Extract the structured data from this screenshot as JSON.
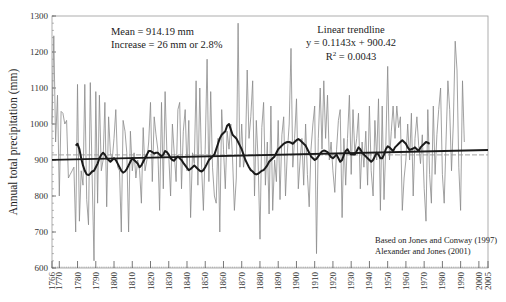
{
  "chart_data": {
    "type": "line",
    "title": "",
    "xlabel": "",
    "ylabel": "Annual total precipitation (mm)",
    "xlim": [
      1766,
      2005
    ],
    "ylim": [
      600,
      1300
    ],
    "yticks": [
      600,
      700,
      800,
      900,
      1000,
      1100,
      1200,
      1300
    ],
    "xticks": [
      1766,
      1770,
      1780,
      1790,
      1800,
      1810,
      1820,
      1830,
      1840,
      1850,
      1860,
      1870,
      1880,
      1890,
      1900,
      1910,
      1920,
      1930,
      1940,
      1950,
      1960,
      1970,
      1980,
      1990,
      2000,
      2005
    ],
    "grid": false,
    "annotations": {
      "mean": "Mean = 914.19 mm",
      "increase": "Increase = 26 mm or 2.8%",
      "trend_title": "Linear trendline",
      "trend_eq": "y = 0.1143x + 900.42",
      "r2_prefix": "R",
      "r2_sup": "2",
      "r2_value": " = 0.0043",
      "source_1": "Based on Jones and Conway (1997)",
      "source_2": "Alexander and Jones (2001)"
    },
    "mean_value": 914.19,
    "trend": {
      "slope": 0.1143,
      "intercept": 900.42
    },
    "series": [
      {
        "name": "Annual total",
        "style": "thin-gray",
        "start_year": 1766,
        "values": [
          1000,
          1245,
          950,
          1080,
          800,
          1035,
          1030,
          1000,
          1010,
          850,
          860,
          870,
          880,
          700,
          1110,
          730,
          870,
          830,
          1110,
          790,
          720,
          1115,
          860,
          620,
          1090,
          780,
          1080,
          870,
          900,
          1060,
          770,
          1020,
          920,
          900,
          960,
          1040,
          880,
          870,
          700,
          1010,
          980,
          920,
          700,
          980,
          870,
          920,
          850,
          900,
          870,
          780,
          990,
          870,
          900,
          950,
          1060,
          840,
          1020,
          970,
          930,
          760,
          1060,
          820,
          1090,
          920,
          910,
          800,
          1000,
          920,
          840,
          1040,
          1060,
          820,
          980,
          1040,
          870,
          1010,
          740,
          920,
          890,
          1120,
          830,
          1100,
          880,
          760,
          930,
          1180,
          840,
          1090,
          880,
          800,
          780,
          960,
          700,
          1040,
          930,
          820,
          980,
          930,
          1000,
          900,
          760,
          850,
          1280,
          880,
          1000,
          880,
          920,
          1150,
          960,
          1020,
          1120,
          800,
          1010,
          900,
          680,
          990,
          1060,
          830,
          950,
          750,
          1050,
          760,
          900,
          840,
          1010,
          790,
          970,
          1020,
          800,
          920,
          1000,
          1210,
          880,
          960,
          1070,
          820,
          900,
          960,
          830,
          1000,
          860,
          770,
          930,
          1000,
          1050,
          640,
          960,
          1100,
          930,
          1120,
          960,
          1080,
          900,
          950,
          870,
          810,
          930,
          1010,
          1040,
          740,
          960,
          830,
          960,
          1080,
          860,
          1040,
          920,
          960,
          1030,
          820,
          950,
          880,
          980,
          830,
          1050,
          870,
          800,
          1010,
          900,
          1070,
          760,
          1050,
          790,
          940,
          1160,
          900,
          980,
          1050,
          960,
          1050,
          990,
          1020,
          760,
          850,
          900,
          1000,
          900,
          1030,
          800,
          960,
          1020,
          940,
          890,
          970,
          820,
          730,
          1040,
          860,
          780,
          1050,
          860,
          970,
          1040,
          1100,
          860,
          780,
          950,
          1120,
          1040,
          870,
          1000,
          1230,
          1150,
          880,
          760,
          1120,
          950
        ]
      },
      {
        "name": "Moving average",
        "style": "thick-black",
        "start_year": 1779,
        "values": [
          940,
          945,
          930,
          905,
          885,
          870,
          860,
          858,
          862,
          868,
          870,
          880,
          890,
          905,
          915,
          920,
          915,
          905,
          900,
          895,
          900,
          905,
          900,
          890,
          880,
          870,
          865,
          868,
          875,
          885,
          895,
          905,
          900,
          895,
          890,
          880,
          885,
          895,
          905,
          915,
          925,
          925,
          922,
          918,
          920,
          920,
          915,
          910,
          915,
          925,
          922,
          915,
          905,
          900,
          898,
          905,
          910,
          905,
          900,
          892,
          885,
          878,
          872,
          875,
          880,
          885,
          880,
          875,
          870,
          868,
          872,
          880,
          890,
          900,
          905,
          910,
          915,
          930,
          945,
          960,
          970,
          975,
          980,
          995,
          1000,
          985,
          970,
          965,
          960,
          950,
          940,
          930,
          915,
          900,
          890,
          880,
          872,
          868,
          862,
          860,
          862,
          866,
          870,
          872,
          878,
          885,
          895,
          900,
          905,
          910,
          920,
          930,
          935,
          940,
          945,
          948,
          950,
          950,
          948,
          945,
          950,
          955,
          958,
          955,
          950,
          945,
          940,
          930,
          920,
          910,
          905,
          900,
          903,
          910,
          918,
          924,
          926,
          925,
          922,
          915,
          908,
          905,
          910,
          915,
          905,
          895,
          900,
          915,
          925,
          930,
          920,
          915,
          915,
          915,
          925,
          935,
          930,
          920,
          915,
          910,
          905,
          900,
          895,
          900,
          910,
          920,
          915,
          905,
          905,
          915,
          930,
          938,
          935,
          930,
          925,
          935,
          940,
          945,
          950,
          955,
          950,
          945,
          935,
          928,
          930,
          932,
          935,
          930,
          925,
          935,
          940,
          945,
          950,
          948,
          945
        ]
      },
      {
        "name": "Linear trendline",
        "style": "thick-black-straight",
        "from": [
          1766,
          900.5
        ],
        "to": [
          2005,
          927.8
        ]
      },
      {
        "name": "Mean",
        "style": "thin-gray-dashed",
        "value": 914.19
      }
    ]
  }
}
